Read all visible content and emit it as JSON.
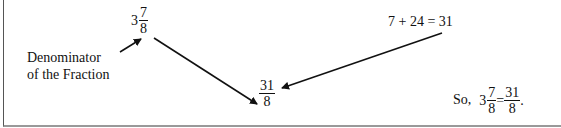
{
  "label": {
    "line1": "Denominator",
    "line2": "of the Fraction"
  },
  "mixed_number": {
    "whole": "3",
    "numerator": "7",
    "denominator": "8"
  },
  "sum_equation": "7 + 24 = 31",
  "improper_fraction": {
    "numerator": "31",
    "denominator": "8"
  },
  "conclusion": {
    "prefix": "So,",
    "whole": "3",
    "numerator": "7",
    "denominator": "8",
    "equals": "=",
    "result_numerator": "31",
    "result_denominator": "8",
    "suffix": "."
  },
  "arrows": [
    {
      "name": "label-to-denominator",
      "from": [
        120,
        52
      ],
      "to": [
        141,
        39
      ]
    },
    {
      "name": "mixed-to-improper",
      "from": [
        154,
        38
      ],
      "to": [
        258,
        104
      ]
    },
    {
      "name": "sum-to-improper",
      "from": [
        442,
        33
      ],
      "to": [
        282,
        88
      ]
    }
  ]
}
